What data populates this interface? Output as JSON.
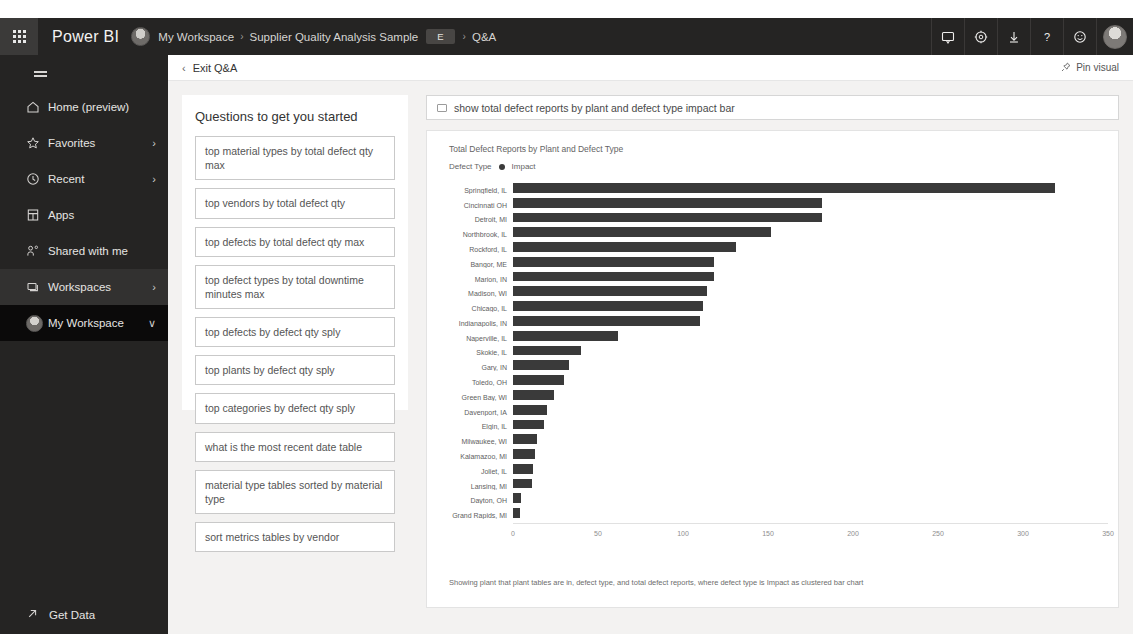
{
  "header": {
    "waffle_icon": "app-launcher-icon",
    "brand": "Power BI",
    "breadcrumb": {
      "workspace": "My Workspace",
      "sep1": "›",
      "report": "Supplier Quality Analysis Sample",
      "chip": "E",
      "sep2": "›",
      "current": "Q&A"
    },
    "actions": [
      {
        "name": "notifications-icon",
        "label": "Notifications"
      },
      {
        "name": "settings-gear-icon",
        "label": "Settings"
      },
      {
        "name": "download-icon",
        "label": "Download"
      },
      {
        "name": "help-icon",
        "label": "Help",
        "glyph": "?"
      },
      {
        "name": "feedback-smiley-icon",
        "label": "Feedback"
      }
    ],
    "avatar": "user-avatar"
  },
  "sidebar": {
    "hamburger": "hamburger-icon",
    "items": [
      {
        "label": "Home (preview)",
        "icon": "home-icon",
        "chevron": ""
      },
      {
        "label": "Favorites",
        "icon": "star-icon",
        "chevron": "›"
      },
      {
        "label": "Recent",
        "icon": "clock-icon",
        "chevron": "›"
      },
      {
        "label": "Apps",
        "icon": "apps-icon",
        "chevron": ""
      },
      {
        "label": "Shared with me",
        "icon": "shared-people-icon",
        "chevron": ""
      },
      {
        "label": "Workspaces",
        "icon": "workspaces-icon",
        "chevron": "›"
      },
      {
        "label": "My Workspace",
        "icon": "workspace-avatar-icon",
        "chevron": "∨"
      }
    ],
    "get_data": {
      "label": "Get Data",
      "icon": "get-data-arrow-icon"
    }
  },
  "subbar": {
    "exit_label": "Exit Q&A",
    "back_chevron": "‹",
    "pin_label": "Pin visual",
    "pin_icon": "pin-icon"
  },
  "questions_panel": {
    "title": "Questions to get you started",
    "items": [
      "top material types by total defect qty max",
      "top vendors by total defect qty",
      "top defects by total defect qty max",
      "top defect types by total downtime minutes max",
      "top defects by defect qty sply",
      "top plants by defect qty sply",
      "top categories by defect qty sply",
      "what is the most recent date table",
      "material type tables sorted by material type",
      "sort metrics tables by vendor"
    ]
  },
  "ask_box": {
    "value": "show total defect reports by plant and defect type impact bar",
    "placeholder": "Ask a question about your data",
    "icon": "keyboard-icon"
  },
  "visual": {
    "caption": "Showing plant that plant tables are in, defect type, and total defect reports, where defect type is Impact as clustered bar chart"
  },
  "chart_data": {
    "type": "bar",
    "orientation": "horizontal",
    "title": "Total Defect Reports by Plant and Defect Type",
    "legend_title": "Defect Type",
    "legend": [
      "Impact"
    ],
    "legend_position": "top-left",
    "xlabel": "",
    "ylabel": "",
    "xlim": [
      0,
      350
    ],
    "xticks": [
      0,
      50,
      100,
      150,
      200,
      250,
      300,
      350
    ],
    "grid": false,
    "series_color": "#3a3a3a",
    "categories": [
      "Springfield, IL",
      "Cincinnati OH",
      "Detroit, MI",
      "Northbrook, IL",
      "Rockford, IL",
      "Bangor, ME",
      "Marion, IN",
      "Madison, WI",
      "Chicago, IL",
      "Indianapolis, IN",
      "Naperville, IL",
      "Skokie, IL",
      "Gary, IN",
      "Toledo, OH",
      "Green Bay, WI",
      "Davenport, IA",
      "Elgin, IL",
      "Milwaukee, WI",
      "Kalamazoo, MI",
      "Joliet, IL",
      "Lansing, MI",
      "Dayton, OH",
      "Grand Rapids, MI"
    ],
    "series": [
      {
        "name": "Impact",
        "values": [
          319,
          182,
          182,
          152,
          131,
          118,
          118,
          114,
          112,
          110,
          62,
          40,
          33,
          30,
          24,
          20,
          18,
          14,
          13,
          12,
          11,
          5,
          4
        ]
      }
    ]
  }
}
